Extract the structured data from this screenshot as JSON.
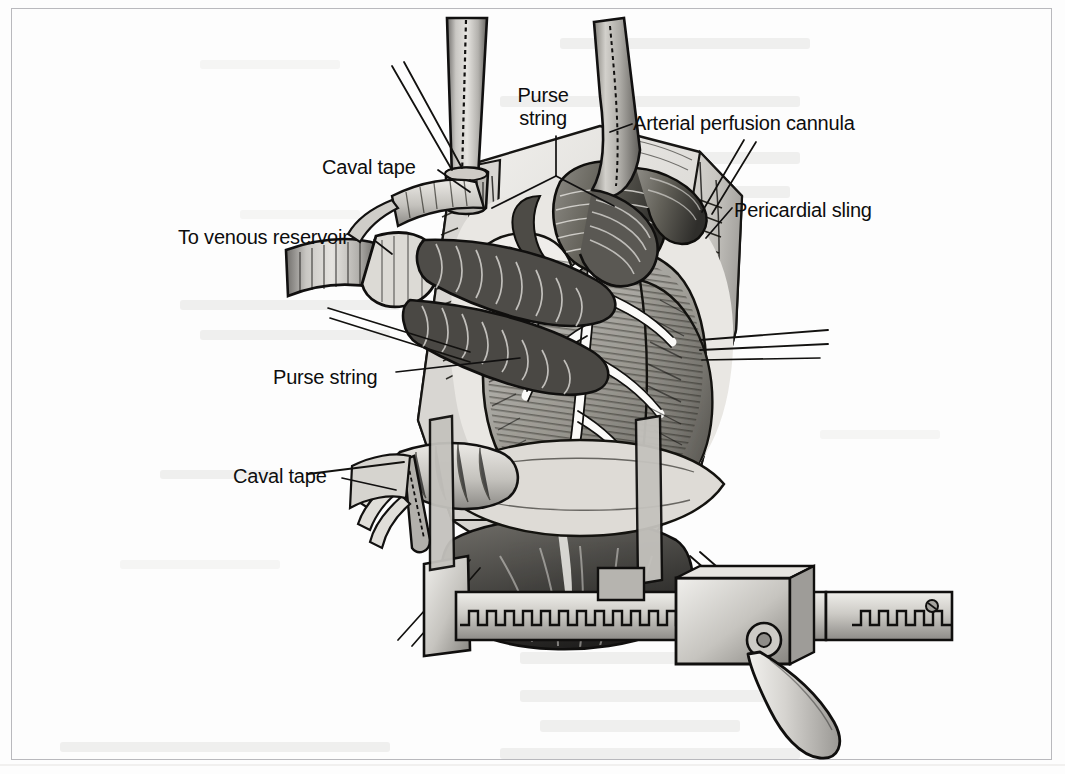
{
  "page": {
    "width": 1065,
    "height": 774,
    "background_color": "#fdfdfd",
    "frame_color": "#b9b9bd",
    "ink_color": "#0d0d0d"
  },
  "figure": {
    "medium": "pen-and-ink stipple / hatch medical illustration",
    "palette": {
      "ink": "#111111",
      "tissue_light": "#e8e6e2",
      "tissue_mid": "#b4b2ae",
      "tissue_dark": "#7d7b78",
      "shadow": "#3a3937",
      "metal_light": "#dedcd8",
      "metal_mid": "#a9a7a3",
      "metal_dark": "#6e6c69"
    }
  },
  "labels": [
    {
      "id": "purse-string-top",
      "text": "Purse\nstring",
      "x": 518,
      "y": 84,
      "align": "center",
      "lines": 2,
      "leader": "branching-v-to-two-cannula-sites"
    },
    {
      "id": "arterial-perfusion-cannula",
      "text": "Arterial perfusion cannula",
      "x": 633,
      "y": 112,
      "align": "left",
      "lines": 1,
      "leader": "short-dash-left-to-ascending-aortic-cannula"
    },
    {
      "id": "caval-tape-top",
      "text": "Caval tape",
      "x": 322,
      "y": 156,
      "align": "left",
      "lines": 1,
      "leader": "diagonal-down-right-to-superior-caval-snare"
    },
    {
      "id": "pericardial-sling",
      "text": "Pericardial sling",
      "x": 734,
      "y": 199,
      "align": "left",
      "lines": 1,
      "leader": "diagonal-down-left-to-pericardial-edge"
    },
    {
      "id": "to-venous-reservoir",
      "text": "To venous reservoir",
      "x": 178,
      "y": 226,
      "align": "left",
      "lines": 1,
      "leader": "short-diagonal-to-y-connector"
    },
    {
      "id": "purse-string-lower",
      "text": "Purse string",
      "x": 273,
      "y": 366,
      "align": "left",
      "lines": 1,
      "leader": "long-horizontal-right-to-atrial-purse-string"
    },
    {
      "id": "caval-tape-lower",
      "text": "Caval tape",
      "x": 233,
      "y": 465,
      "align": "left",
      "lines": 1,
      "leader": "diagonal-down-right-to-inferior-caval-snare"
    }
  ],
  "anatomy": [
    {
      "id": "heart",
      "name": "Heart (right ventricle, left ventricle, atrial appendage)"
    },
    {
      "id": "aorta",
      "name": "Ascending aorta / aortic root"
    },
    {
      "id": "pericardium",
      "name": "Pericardial sling with stay sutures"
    },
    {
      "id": "svc",
      "name": "Superior vena cava with caval tape"
    },
    {
      "id": "ivc",
      "name": "Inferior vena cava with caval tape"
    },
    {
      "id": "diaphragm",
      "name": "Diaphragmatic surface / cardiac apex shadow"
    }
  ],
  "instruments": [
    {
      "id": "aortic-cannula",
      "name": "Arterial perfusion cannula"
    },
    {
      "id": "venous-cannula-superior",
      "name": "Superior venous cannula"
    },
    {
      "id": "venous-cannula-inferior",
      "name": "Inferior venous cannula"
    },
    {
      "id": "y-connector",
      "name": "Y connector to venous reservoir"
    },
    {
      "id": "sternal-retractor",
      "name": "Sternal retractor with toothed rack and handle"
    },
    {
      "id": "stay-sutures",
      "name": "Pericardial stay sutures"
    }
  ]
}
